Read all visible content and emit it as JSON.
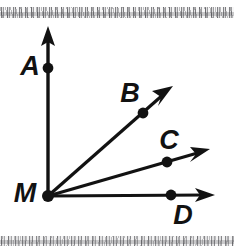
{
  "figure": {
    "background_color": "#ffffff",
    "ink_color": "#121212",
    "vertex": {
      "name": "M",
      "label": "M",
      "x": 48,
      "y": 196,
      "label_x": 25,
      "label_y": 195
    },
    "rays": [
      {
        "id": "MA",
        "label": "A",
        "point_label": "A",
        "from_x": 48,
        "from_y": 196,
        "tip_x": 48,
        "tip_y": 27,
        "dot_x": 48,
        "dot_y": 68,
        "label_x": 30,
        "label_y": 68,
        "stroke_width": 3.4
      },
      {
        "id": "MB",
        "label": "B",
        "point_label": "B",
        "from_x": 48,
        "from_y": 196,
        "tip_x": 172,
        "tip_y": 87,
        "dot_x": 143,
        "dot_y": 113,
        "label_x": 130,
        "label_y": 95,
        "stroke_width": 3.2
      },
      {
        "id": "MC",
        "label": "C",
        "point_label": "C",
        "from_x": 48,
        "from_y": 196,
        "tip_x": 209,
        "tip_y": 150,
        "dot_x": 167,
        "dot_y": 162,
        "label_x": 169,
        "label_y": 142,
        "stroke_width": 3.2
      },
      {
        "id": "MD",
        "label": "D",
        "point_label": "D",
        "from_x": 48,
        "from_y": 196,
        "tip_x": 214,
        "tip_y": 195,
        "dot_x": 171,
        "dot_y": 195,
        "label_x": 183,
        "label_y": 217,
        "stroke_width": 3.2
      }
    ],
    "label_font_size": 27,
    "dot_radius": 5.2,
    "scan_bands": {
      "top_label": "scan-noise-band-top",
      "bottom_label": "scan-noise-band-bottom"
    }
  }
}
